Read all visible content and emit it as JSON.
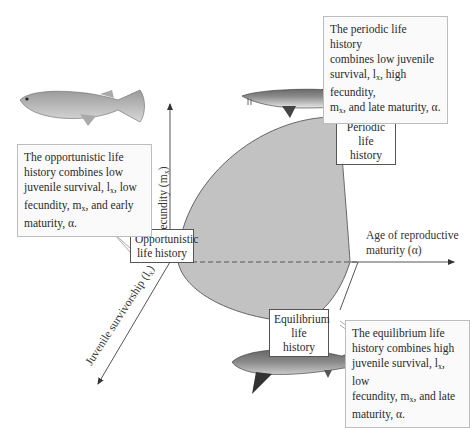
{
  "figure": {
    "type": "life-history-triangle",
    "colors": {
      "region_fill": "#c2c2c2",
      "region_stroke": "#666666",
      "axis": "#555555",
      "callout_border": "#bdbdbd"
    }
  },
  "axes": {
    "y": {
      "label": "Fecundity (m",
      "sub": "x",
      "close": ")"
    },
    "x": {
      "line1": "Age of reproductive",
      "line2": "maturity (α)"
    },
    "z": {
      "label": "Juvenile survivorship (l",
      "sub": "x",
      "close": ")"
    }
  },
  "corners": {
    "opportunistic": {
      "line1": "Opportunistic",
      "line2": "life history"
    },
    "periodic": {
      "line1": "Periodic",
      "line2": "life history"
    },
    "equilibrium": {
      "line1": "Equilibrium",
      "line2": "life history"
    }
  },
  "callouts": {
    "periodic": {
      "lines": [
        "The periodic life history",
        "combines low juvenile",
        "survival, l",
        "x",
        ", high fecundity,",
        "m",
        "x",
        ", and late maturity, α."
      ]
    },
    "opportunistic": {
      "lines": [
        "The opportunistic life",
        "history combines low",
        "juvenile survival, l",
        "x",
        ", low",
        "fecundity, m",
        "x",
        ", and early",
        "maturity, α."
      ]
    },
    "equilibrium": {
      "lines": [
        "The equilibrium life",
        "history combines high",
        "juvenile survival, l",
        "x",
        ", low",
        "fecundity, m",
        "x",
        ", and late",
        "maturity, α."
      ]
    }
  },
  "images": {
    "guppy": "guppy-fish",
    "sturgeon": "sturgeon-fish",
    "shark": "shark-fish"
  }
}
